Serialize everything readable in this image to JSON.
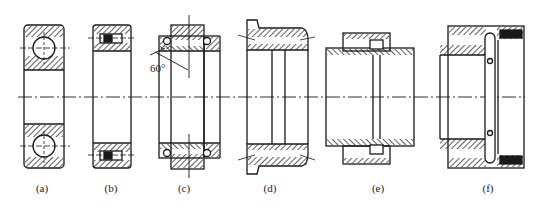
{
  "figure": {
    "labels": [
      {
        "id": "a",
        "text": "(a)",
        "x": 42
      },
      {
        "id": "b",
        "text": "(b)",
        "x": 111
      },
      {
        "id": "c",
        "text": "(c)",
        "x": 184
      },
      {
        "id": "d",
        "text": "(d)",
        "x": 270
      },
      {
        "id": "e",
        "text": "(e)",
        "x": 378
      },
      {
        "id": "f",
        "text": "(f)",
        "x": 488
      }
    ],
    "annotation_angle": "60°",
    "colors": {
      "line": "#1a1a1a",
      "background": "#ffffff"
    }
  }
}
